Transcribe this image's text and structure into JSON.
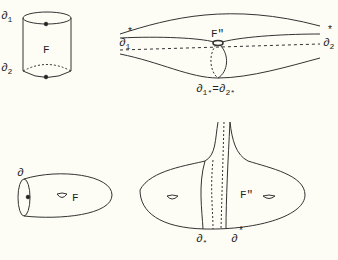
{
  "figure": {
    "cylinder": {
      "boundary_top": "∂",
      "boundary_top_sub": "1",
      "boundary_bottom": "∂",
      "boundary_bottom_sub": "2",
      "surface": "F"
    },
    "lens": {
      "left_boundary": "∂",
      "left_sub": "1",
      "left_star": "*",
      "right_boundary": "∂",
      "right_sub": "2",
      "right_star": "*",
      "surface": "F\"",
      "caption_a": "∂",
      "caption_a_sub": "1*",
      "caption_eq": "=",
      "caption_b": "∂",
      "caption_b_sub": "2*"
    },
    "handle_surface": {
      "boundary": "∂",
      "surface": "F"
    },
    "funnel_surface": {
      "surface": "F\"",
      "boundary_star_left": "∂",
      "boundary_star_left_sub": "*",
      "boundary_right": "∂",
      "boundary_right_star": "*"
    },
    "stroke_color": "#333333",
    "background_color": "#fdfdf5"
  }
}
